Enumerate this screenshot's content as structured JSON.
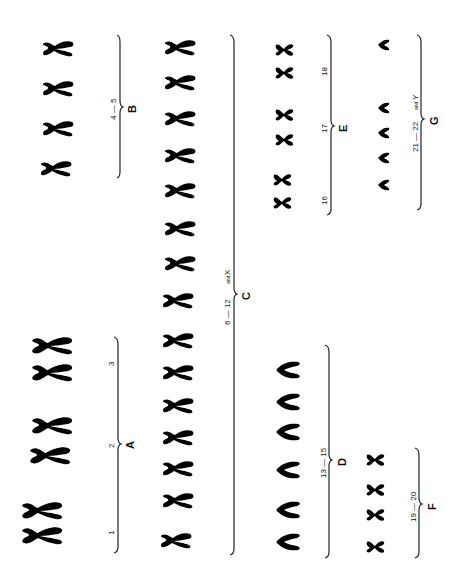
{
  "groups": [
    {
      "id": "A",
      "letter": "A",
      "range_label": "",
      "numbers": [
        "1",
        "2",
        "3"
      ],
      "count": 6
    },
    {
      "id": "B",
      "letter": "B",
      "range_label": "4 — 5",
      "count": 4
    },
    {
      "id": "C",
      "letter": "C",
      "range_label": "6 — 12",
      "extra": "and",
      "extra_x": "X",
      "count": 16
    },
    {
      "id": "D",
      "letter": "D",
      "range_label": "13 — 15",
      "count": 6
    },
    {
      "id": "E",
      "letter": "E",
      "numbers": [
        "16",
        "17",
        "18"
      ],
      "count": 6
    },
    {
      "id": "F",
      "letter": "F",
      "range_label": "19 — 20",
      "count": 4
    },
    {
      "id": "G",
      "letter": "G",
      "range_label": "21 — 22",
      "extra": "and",
      "extra_x": "Y",
      "count": 5
    }
  ],
  "labels": {
    "A": {
      "letter": "A",
      "n1": "1",
      "n2": "2",
      "n3": "3"
    },
    "B": {
      "letter": "B",
      "range": "4 — 5"
    },
    "C": {
      "letter": "C",
      "range": "6 — 12",
      "and": "and",
      "x": "X"
    },
    "D": {
      "letter": "D",
      "range": "13 — 15"
    },
    "E": {
      "letter": "E",
      "n16": "16",
      "n17": "17",
      "n18": "18"
    },
    "F": {
      "letter": "F",
      "range": "19 — 20"
    },
    "G": {
      "letter": "G",
      "range": "21 — 22",
      "and": "and",
      "y": "Y"
    }
  },
  "colors": {
    "ink": "#151515",
    "background": "#ffffff"
  }
}
